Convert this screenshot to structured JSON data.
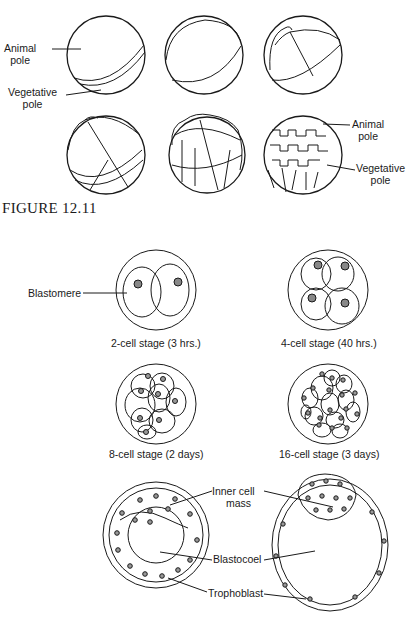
{
  "figure_top": {
    "labels": {
      "animal_pole_left": [
        "Animal",
        "pole"
      ],
      "vegetative_pole_left": [
        "Vegetative",
        "pole"
      ],
      "animal_pole_right": [
        "Animal",
        "pole"
      ],
      "vegetative_pole_right": [
        "Vegetative",
        "pole"
      ]
    }
  },
  "figure_title": "FIGURE 12.11",
  "figure_bottom": {
    "labels": {
      "blastomere": "Blastomere",
      "inner_cell_mass": [
        "Inner cell",
        "mass"
      ],
      "blastocoel": "Blastocoel",
      "trophoblast": "Trophoblast"
    },
    "captions": [
      "2-cell stage (3 hrs.)",
      "4-cell stage (40 hrs.)",
      "8-cell stage (2 days)",
      "16-cell stage (3 days)"
    ]
  }
}
